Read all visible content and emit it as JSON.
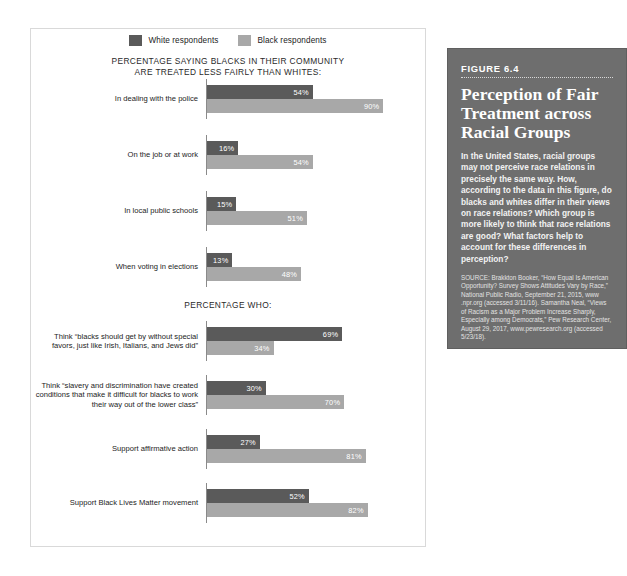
{
  "legend": {
    "items": [
      {
        "label": "White respondents",
        "color": "#5a5a5a",
        "key": "white"
      },
      {
        "label": "Black respondents",
        "color": "#a8a8a8",
        "key": "black"
      }
    ]
  },
  "sections": [
    {
      "heading_line1": "PERCENTAGE SAYING BLACKS IN THEIR COMMUNITY",
      "heading_line2": "ARE TREATED LESS FAIRLY THAN WHITES:",
      "groups": [
        {
          "label": "In dealing with the police",
          "white": 54,
          "black": 90,
          "white_text": "54%",
          "black_text": "90%"
        },
        {
          "label": "On the job or at work",
          "white": 16,
          "black": 54,
          "white_text": "16%",
          "black_text": "54%"
        },
        {
          "label": "In local public schools",
          "white": 15,
          "black": 51,
          "white_text": "15%",
          "black_text": "51%"
        },
        {
          "label": "When voting in elections",
          "white": 13,
          "black": 48,
          "white_text": "13%",
          "black_text": "48%"
        }
      ]
    },
    {
      "heading_line1": "PERCENTAGE WHO:",
      "heading_line2": "",
      "groups": [
        {
          "label": "Think “blacks should get by without special favors, just like Irish, Italians, and Jews did”",
          "white": 69,
          "black": 34,
          "white_text": "69%",
          "black_text": "34%"
        },
        {
          "label": "Think “slavery and discrimination have created conditions that make it difficult for blacks to work their way out of the lower class”",
          "white": 30,
          "black": 70,
          "white_text": "30%",
          "black_text": "70%"
        },
        {
          "label": "Support affirmative action",
          "white": 27,
          "black": 81,
          "white_text": "27%",
          "black_text": "81%"
        },
        {
          "label": "Support Black Lives Matter movement",
          "white": 52,
          "black": 82,
          "white_text": "52%",
          "black_text": "82%"
        }
      ]
    }
  ],
  "figure": {
    "kicker": "FIGURE 6.4",
    "title": "Perception of Fair Treatment across Racial Groups",
    "body": "In the United States, racial groups may not perceive race relations in precisely the same way. How, according to the data in this figure, do blacks and whites differ in their views on race relations? Which group is more likely to think that race relations are good? What factors help to account for these differences in perception?",
    "source": "SOURCE: Brakkton Booker, “How Equal Is American Opportunity? Survey Shows Attitudes Vary by Race,” National Public Radio, September 21, 2015, www .npr.org (accessed 3/11/16). Samantha Neal, “Views of Racism as a Major Problem Increase Sharply, Especially among Democrats,” Pew Research Center, August 29, 2017, www.pewresearch.org (accessed 5/23/18)."
  },
  "chart_data": {
    "type": "bar",
    "title": "Perception of Fair Treatment across Racial Groups",
    "orientation": "horizontal",
    "xlabel": "Percentage",
    "ylabel": "",
    "xlim": [
      0,
      100
    ],
    "grid": false,
    "legend_position": "top-center",
    "categories": [
      "In dealing with the police",
      "On the job or at work",
      "In local public schools",
      "When voting in elections",
      "Think “blacks should get by without special favors, just like Irish, Italians, and Jews did”",
      "Think “slavery and discrimination have created conditions that make it difficult for blacks to work their way out of the lower class”",
      "Support affirmative action",
      "Support Black Lives Matter movement"
    ],
    "series": [
      {
        "name": "White respondents",
        "color": "#5a5a5a",
        "values": [
          54,
          16,
          15,
          13,
          69,
          30,
          27,
          52
        ]
      },
      {
        "name": "Black respondents",
        "color": "#a8a8a8",
        "values": [
          90,
          54,
          51,
          48,
          34,
          70,
          81,
          82
        ]
      }
    ],
    "section_headings": [
      "PERCENTAGE SAYING BLACKS IN THEIR COMMUNITY ARE TREATED LESS FAIRLY THAN WHITES:",
      "PERCENTAGE WHO:"
    ]
  }
}
